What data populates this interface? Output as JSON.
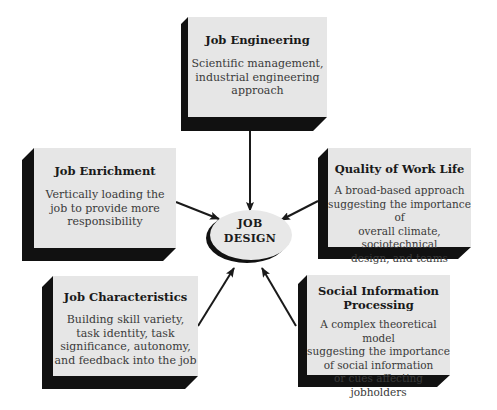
{
  "diagram": {
    "center": {
      "line1": "JOB",
      "line2": "DESIGN"
    },
    "nodes": [
      {
        "id": "job-engineering",
        "title": "Job Engineering",
        "description": [
          "Scientific management,",
          "industrial engineering",
          "approach"
        ]
      },
      {
        "id": "job-enrichment",
        "title": "Job Enrichment",
        "description": [
          "Vertically loading the",
          "job to provide more",
          "responsibility"
        ]
      },
      {
        "id": "quality-of-work-life",
        "title": "Quality of Work Life",
        "description": [
          "A broad-based approach",
          "suggesting the importance of",
          "overall climate, sociotechnical",
          "design, and teams"
        ]
      },
      {
        "id": "job-characteristics",
        "title": "Job Characteristics",
        "description": [
          "Building skill variety,",
          "task identity, task",
          "significance, autonomy,",
          "and feedback into the job"
        ]
      },
      {
        "id": "social-information-processing",
        "title_lines": [
          "Social Information",
          "Processing"
        ],
        "description": [
          "A complex theoretical model",
          "suggesting the importance",
          "of social information",
          "or cues affecting jobholders"
        ]
      }
    ],
    "edges": [
      {
        "from": "job-engineering",
        "to": "center"
      },
      {
        "from": "job-enrichment",
        "to": "center"
      },
      {
        "from": "quality-of-work-life",
        "to": "center"
      },
      {
        "from": "job-characteristics",
        "to": "center"
      },
      {
        "from": "social-information-processing",
        "to": "center"
      }
    ],
    "colors": {
      "face": "#e6e6e6",
      "shadow": "#111111",
      "ellipse": "#e8e8e8",
      "arrow": "#1a1a1a"
    }
  }
}
